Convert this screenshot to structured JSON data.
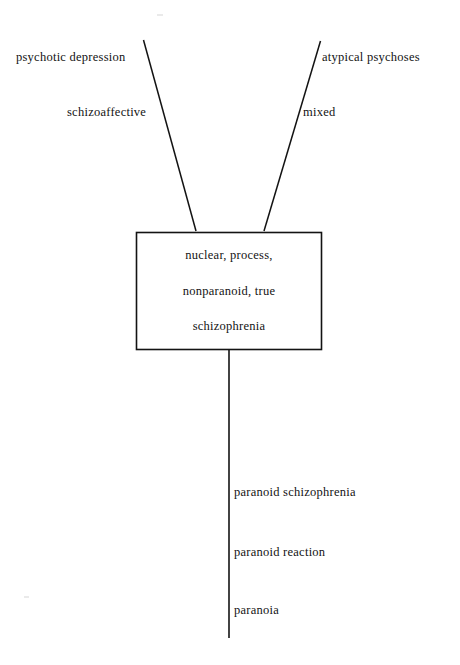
{
  "figure": {
    "type": "node-link-diagram",
    "title": "",
    "background_color": "#ffffff",
    "ink_color": "#131313",
    "center_node": {
      "shape": "rectangle",
      "lines": [
        "nuclear, process,",
        "nonparanoid, true",
        "schizophrenia"
      ]
    },
    "branch_labels": {
      "upper_left_outer": "psychotic depression",
      "upper_left_inner": "schizoaffective",
      "upper_right_outer": "atypical psychoses",
      "upper_right_inner": "mixed"
    },
    "axis_labels": [
      "paranoid schizophrenia",
      "paranoid reaction",
      "paranoia"
    ],
    "connectors": [
      {
        "name": "left-diagonal",
        "from": "psychotic depression",
        "to": "center-box"
      },
      {
        "name": "right-diagonal",
        "from": "atypical psychoses",
        "to": "center-box"
      },
      {
        "name": "vertical-axis",
        "from": "center-box",
        "to": "paranoia"
      }
    ]
  }
}
